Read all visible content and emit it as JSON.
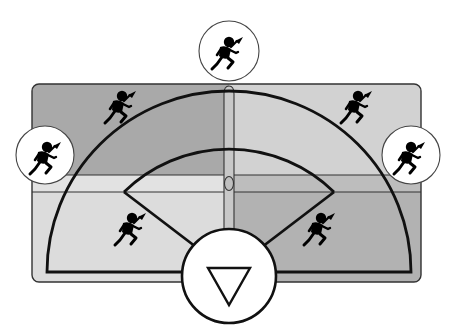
{
  "diagram": {
    "title": "Baseball field positions diagram",
    "colors": {
      "background": "#ffffff",
      "quadrant_top_left": "#a9a9a9",
      "quadrant_top_right": "#d2d2d2",
      "band_left": "#e2e2e2",
      "band_right": "#bdbdbd",
      "quadrant_bottom_left": "#dcdcdc",
      "quadrant_bottom_right": "#b2b2b2",
      "center_strip": "#c8c8c8",
      "lines": "#111111",
      "circle_fill": "#ffffff",
      "figure": "#000000"
    },
    "field": {
      "outer_arc_label": "outfield boundary",
      "inner_arc_label": "infield boundary",
      "home_marker": "inverted-triangle"
    },
    "players": [
      {
        "id": "center-field",
        "circled": true
      },
      {
        "id": "left-field",
        "circled": true
      },
      {
        "id": "right-field",
        "circled": true
      },
      {
        "id": "left-center",
        "circled": false
      },
      {
        "id": "right-center",
        "circled": false
      },
      {
        "id": "third-base",
        "circled": false
      },
      {
        "id": "first-base",
        "circled": false
      }
    ]
  }
}
